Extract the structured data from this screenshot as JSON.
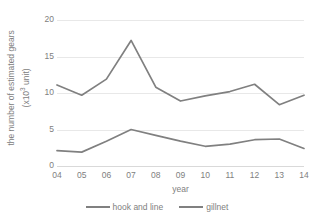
{
  "chart_data": {
    "type": "line",
    "title": "",
    "xlabel": "year",
    "ylabel_line1": "the number of estimated gears",
    "ylabel_line2": "(x10³ unit)",
    "ylabel_prefix": "(x10",
    "ylabel_sup": "3",
    "ylabel_suffix": " unit)",
    "categories": [
      "04",
      "05",
      "06",
      "07",
      "08",
      "09",
      "10",
      "11",
      "12",
      "13",
      "14"
    ],
    "ylim": [
      0,
      20
    ],
    "yticks": [
      0,
      5,
      10,
      15,
      20
    ],
    "ytick_labels": [
      "0",
      "5",
      "10",
      "15",
      "20"
    ],
    "grid": true,
    "legend_position": "bottom",
    "series": [
      {
        "name": "hook and line",
        "color": "#808080",
        "values": [
          2.1,
          1.9,
          3.4,
          5.0,
          4.2,
          3.4,
          2.7,
          3.0,
          3.6,
          3.7,
          2.4
        ]
      },
      {
        "name": "gillnet",
        "color": "#808080",
        "values": [
          11.1,
          9.7,
          11.9,
          17.2,
          10.8,
          8.9,
          9.6,
          10.2,
          11.2,
          8.4,
          9.7
        ]
      }
    ]
  },
  "legend": {
    "items": [
      {
        "label": "hook and line",
        "color": "#808080"
      },
      {
        "label": "gillnet",
        "color": "#808080"
      }
    ]
  },
  "colors": {
    "gridline": "#e8e8e8",
    "text": "#808080",
    "background": "#ffffff",
    "line": "#808080"
  }
}
